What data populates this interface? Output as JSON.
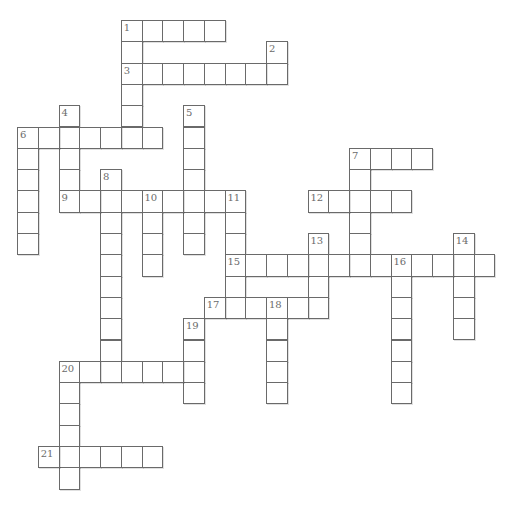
{
  "puzzle": {
    "type": "crossword",
    "grid_columns": 23,
    "grid_rows": 22,
    "entries": [
      {
        "number": "1",
        "direction": "across",
        "row": 0,
        "col": 5,
        "length": 5
      },
      {
        "number": "1",
        "direction": "down",
        "row": 0,
        "col": 5,
        "length": 6
      },
      {
        "number": "2",
        "direction": "down",
        "row": 1,
        "col": 12,
        "length": 2
      },
      {
        "number": "3",
        "direction": "across",
        "row": 2,
        "col": 5,
        "length": 8
      },
      {
        "number": "4",
        "direction": "down",
        "row": 4,
        "col": 2,
        "length": 5
      },
      {
        "number": "5",
        "direction": "down",
        "row": 4,
        "col": 8,
        "length": 7
      },
      {
        "number": "6",
        "direction": "across",
        "row": 5,
        "col": 0,
        "length": 7
      },
      {
        "number": "6",
        "direction": "down",
        "row": 5,
        "col": 0,
        "length": 6
      },
      {
        "number": "7",
        "direction": "across",
        "row": 6,
        "col": 16,
        "length": 4
      },
      {
        "number": "7",
        "direction": "down",
        "row": 6,
        "col": 16,
        "length": 6
      },
      {
        "number": "8",
        "direction": "down",
        "row": 7,
        "col": 4,
        "length": 10
      },
      {
        "number": "9",
        "direction": "across",
        "row": 8,
        "col": 2,
        "length": 9
      },
      {
        "number": "10",
        "direction": "down",
        "row": 8,
        "col": 6,
        "length": 4
      },
      {
        "number": "11",
        "direction": "down",
        "row": 8,
        "col": 10,
        "length": 6
      },
      {
        "number": "12",
        "direction": "across",
        "row": 8,
        "col": 14,
        "length": 5
      },
      {
        "number": "13",
        "direction": "down",
        "row": 10,
        "col": 14,
        "length": 4
      },
      {
        "number": "14",
        "direction": "down",
        "row": 10,
        "col": 21,
        "length": 5
      },
      {
        "number": "15",
        "direction": "across",
        "row": 11,
        "col": 10,
        "length": 13
      },
      {
        "number": "16",
        "direction": "down",
        "row": 11,
        "col": 18,
        "length": 7
      },
      {
        "number": "17",
        "direction": "across",
        "row": 13,
        "col": 9,
        "length": 6
      },
      {
        "number": "18",
        "direction": "down",
        "row": 13,
        "col": 12,
        "length": 5
      },
      {
        "number": "19",
        "direction": "down",
        "row": 14,
        "col": 8,
        "length": 4
      },
      {
        "number": "20",
        "direction": "across",
        "row": 16,
        "col": 2,
        "length": 7
      },
      {
        "number": "20",
        "direction": "down",
        "row": 16,
        "col": 2,
        "length": 6
      },
      {
        "number": "21",
        "direction": "across",
        "row": 20,
        "col": 1,
        "length": 6
      }
    ]
  }
}
